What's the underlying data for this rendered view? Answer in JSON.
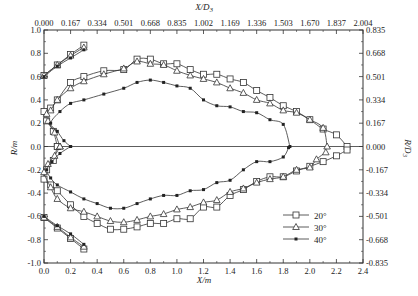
{
  "chart_data": {
    "type": "line",
    "title": "",
    "xlabel": "X/m",
    "ylabel": "R/m",
    "x2label": "X/D3",
    "y2label": "R/D3",
    "xlim": [
      0,
      2.4
    ],
    "ylim": [
      -1.0,
      1.0
    ],
    "x2lim": [
      0,
      2.004
    ],
    "y2lim": [
      -0.835,
      0.835
    ],
    "grid": false,
    "legend_position": "bottom-right",
    "x_ticks": [
      "0.0",
      "0.2",
      "0.4",
      "0.6",
      "0.8",
      "1.0",
      "1.2",
      "1.4",
      "1.6",
      "1.8",
      "2.0",
      "2.2",
      "2.4"
    ],
    "x_tick_values": [
      0,
      0.2,
      0.4,
      0.6,
      0.8,
      1.0,
      1.2,
      1.4,
      1.6,
      1.8,
      2.0,
      2.2,
      2.4
    ],
    "y_ticks": [
      "1.0",
      "0.8",
      "0.6",
      "0.4",
      "0.2",
      "0.0",
      "-0.2",
      "-0.4",
      "-0.6",
      "-0.8",
      "-1.0"
    ],
    "y_tick_values": [
      1.0,
      0.8,
      0.6,
      0.4,
      0.2,
      0.0,
      -0.2,
      -0.4,
      -0.6,
      -0.8,
      -1.0
    ],
    "x2_ticks": [
      "0.000",
      "0.167",
      "0.334",
      "0.501",
      "0.668",
      "0.835",
      "1.002",
      "1.169",
      "1.336",
      "1.503",
      "1.670",
      "1.837",
      "2.004"
    ],
    "y2_ticks": [
      "0.835",
      "0.668",
      "0.501",
      "0.334",
      "0.167",
      "0.000",
      "-0.167",
      "-0.334",
      "-0.501",
      "-0.668",
      "-0.835"
    ],
    "legend_title_sub": "3",
    "series": [
      {
        "name": "20°",
        "marker": "square",
        "upper_line": [
          [
            0.0,
            0.61
          ],
          [
            0.1,
            0.7
          ],
          [
            0.2,
            0.79
          ],
          [
            0.3,
            0.87
          ]
        ],
        "lower_line": [
          [
            0.0,
            -0.61
          ],
          [
            0.1,
            -0.7
          ],
          [
            0.2,
            -0.79
          ],
          [
            0.3,
            -0.88
          ]
        ],
        "upper": [
          [
            0.1,
            0.0
          ],
          [
            0.07,
            0.13
          ],
          [
            0.02,
            0.22
          ],
          [
            0.0,
            0.3
          ],
          [
            0.05,
            0.33
          ],
          [
            0.1,
            0.4
          ],
          [
            0.2,
            0.55
          ],
          [
            0.3,
            0.6
          ],
          [
            0.45,
            0.65
          ],
          [
            0.6,
            0.66
          ],
          [
            0.7,
            0.75
          ],
          [
            0.8,
            0.75
          ],
          [
            0.9,
            0.71
          ],
          [
            1.0,
            0.71
          ],
          [
            1.1,
            0.66
          ],
          [
            1.2,
            0.62
          ],
          [
            1.3,
            0.62
          ],
          [
            1.4,
            0.58
          ],
          [
            1.5,
            0.55
          ],
          [
            1.6,
            0.48
          ],
          [
            1.7,
            0.42
          ],
          [
            1.8,
            0.35
          ],
          [
            1.9,
            0.3
          ],
          [
            2.0,
            0.23
          ],
          [
            2.1,
            0.15
          ],
          [
            2.2,
            0.1
          ],
          [
            2.28,
            0.0
          ]
        ],
        "lower": [
          [
            2.28,
            -0.03
          ],
          [
            2.2,
            -0.08
          ],
          [
            2.1,
            -0.13
          ],
          [
            2.0,
            -0.17
          ],
          [
            1.9,
            -0.21
          ],
          [
            1.8,
            -0.26
          ],
          [
            1.7,
            -0.26
          ],
          [
            1.6,
            -0.3
          ],
          [
            1.5,
            -0.37
          ],
          [
            1.4,
            -0.42
          ],
          [
            1.3,
            -0.52
          ],
          [
            1.2,
            -0.52
          ],
          [
            1.1,
            -0.62
          ],
          [
            1.0,
            -0.62
          ],
          [
            0.9,
            -0.66
          ],
          [
            0.8,
            -0.66
          ],
          [
            0.7,
            -0.69
          ],
          [
            0.6,
            -0.71
          ],
          [
            0.5,
            -0.71
          ],
          [
            0.4,
            -0.66
          ],
          [
            0.3,
            -0.6
          ],
          [
            0.2,
            -0.5
          ],
          [
            0.1,
            -0.38
          ],
          [
            0.05,
            -0.33
          ],
          [
            0.0,
            -0.28
          ],
          [
            0.02,
            -0.2
          ],
          [
            0.07,
            -0.12
          ],
          [
            0.1,
            0.0
          ]
        ]
      },
      {
        "name": "30°",
        "marker": "triangle",
        "upper_line": [
          [
            0.0,
            0.61
          ],
          [
            0.1,
            0.7
          ],
          [
            0.2,
            0.78
          ],
          [
            0.3,
            0.85
          ]
        ],
        "lower_line": [
          [
            0.0,
            -0.61
          ],
          [
            0.1,
            -0.69
          ],
          [
            0.2,
            -0.78
          ],
          [
            0.3,
            -0.86
          ]
        ],
        "upper": [
          [
            0.12,
            0.0
          ],
          [
            0.08,
            0.12
          ],
          [
            0.03,
            0.22
          ],
          [
            0.02,
            0.28
          ],
          [
            0.05,
            0.31
          ],
          [
            0.1,
            0.4
          ],
          [
            0.2,
            0.5
          ],
          [
            0.3,
            0.56
          ],
          [
            0.45,
            0.62
          ],
          [
            0.6,
            0.67
          ],
          [
            0.7,
            0.73
          ],
          [
            0.8,
            0.71
          ],
          [
            0.9,
            0.7
          ],
          [
            1.0,
            0.65
          ],
          [
            1.1,
            0.61
          ],
          [
            1.2,
            0.58
          ],
          [
            1.3,
            0.55
          ],
          [
            1.4,
            0.5
          ],
          [
            1.5,
            0.46
          ],
          [
            1.6,
            0.4
          ],
          [
            1.7,
            0.37
          ],
          [
            1.8,
            0.31
          ],
          [
            1.9,
            0.29
          ],
          [
            2.0,
            0.23
          ],
          [
            2.1,
            0.16
          ],
          [
            2.13,
            0.0
          ]
        ],
        "lower": [
          [
            2.12,
            -0.05
          ],
          [
            2.05,
            -0.11
          ],
          [
            2.0,
            -0.18
          ],
          [
            1.9,
            -0.2
          ],
          [
            1.8,
            -0.26
          ],
          [
            1.7,
            -0.28
          ],
          [
            1.6,
            -0.31
          ],
          [
            1.5,
            -0.36
          ],
          [
            1.4,
            -0.39
          ],
          [
            1.3,
            -0.46
          ],
          [
            1.2,
            -0.48
          ],
          [
            1.1,
            -0.52
          ],
          [
            1.0,
            -0.54
          ],
          [
            0.9,
            -0.58
          ],
          [
            0.8,
            -0.6
          ],
          [
            0.7,
            -0.63
          ],
          [
            0.6,
            -0.65
          ],
          [
            0.5,
            -0.64
          ],
          [
            0.4,
            -0.6
          ],
          [
            0.3,
            -0.56
          ],
          [
            0.2,
            -0.53
          ],
          [
            0.1,
            -0.45
          ],
          [
            0.05,
            -0.35
          ],
          [
            0.0,
            -0.22
          ],
          [
            0.03,
            -0.15
          ],
          [
            0.08,
            -0.08
          ],
          [
            0.12,
            0.0
          ]
        ]
      },
      {
        "name": "40°",
        "marker": "filled-circle",
        "upper_line": [
          [
            0.0,
            0.6
          ],
          [
            0.1,
            0.69
          ],
          [
            0.2,
            0.76
          ],
          [
            0.3,
            0.83
          ]
        ],
        "lower_line": [
          [
            0.0,
            -0.6
          ],
          [
            0.1,
            -0.68
          ],
          [
            0.2,
            -0.75
          ],
          [
            0.3,
            -0.84
          ]
        ],
        "upper": [
          [
            0.2,
            0.0
          ],
          [
            0.15,
            0.05
          ],
          [
            0.1,
            0.13
          ],
          [
            0.05,
            0.2
          ],
          [
            0.12,
            0.3
          ],
          [
            0.2,
            0.37
          ],
          [
            0.3,
            0.4
          ],
          [
            0.45,
            0.45
          ],
          [
            0.6,
            0.5
          ],
          [
            0.7,
            0.55
          ],
          [
            0.8,
            0.57
          ],
          [
            0.9,
            0.55
          ],
          [
            1.0,
            0.52
          ],
          [
            1.1,
            0.5
          ],
          [
            1.2,
            0.4
          ],
          [
            1.3,
            0.35
          ],
          [
            1.4,
            0.34
          ],
          [
            1.5,
            0.3
          ],
          [
            1.6,
            0.29
          ],
          [
            1.7,
            0.23
          ],
          [
            1.8,
            0.19
          ],
          [
            1.85,
            0.0
          ]
        ],
        "lower": [
          [
            1.84,
            -0.01
          ],
          [
            1.8,
            -0.09
          ],
          [
            1.7,
            -0.13
          ],
          [
            1.6,
            -0.13
          ],
          [
            1.5,
            -0.2
          ],
          [
            1.4,
            -0.29
          ],
          [
            1.3,
            -0.31
          ],
          [
            1.2,
            -0.37
          ],
          [
            1.1,
            -0.38
          ],
          [
            1.0,
            -0.42
          ],
          [
            0.9,
            -0.42
          ],
          [
            0.8,
            -0.45
          ],
          [
            0.7,
            -0.49
          ],
          [
            0.6,
            -0.53
          ],
          [
            0.5,
            -0.53
          ],
          [
            0.4,
            -0.49
          ],
          [
            0.3,
            -0.45
          ],
          [
            0.2,
            -0.39
          ],
          [
            0.1,
            -0.33
          ],
          [
            0.05,
            -0.27
          ],
          [
            0.02,
            -0.2
          ],
          [
            0.06,
            -0.13
          ],
          [
            0.12,
            -0.06
          ],
          [
            0.2,
            0.0
          ]
        ]
      }
    ]
  }
}
